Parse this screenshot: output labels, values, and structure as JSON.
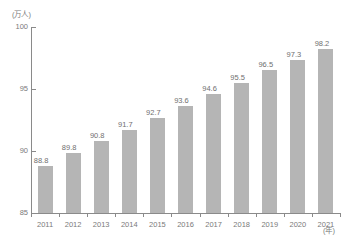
{
  "chart_data": {
    "type": "bar",
    "title": "",
    "subtitle": "",
    "xlabel": "(年)",
    "ylabel": "(万人)",
    "categories": [
      "2011",
      "2012",
      "2013",
      "2014",
      "2015",
      "2016",
      "2017",
      "2018",
      "2019",
      "2020",
      "2021"
    ],
    "values": [
      88.8,
      89.8,
      90.8,
      91.7,
      92.7,
      93.6,
      94.6,
      95.5,
      96.5,
      97.3,
      98.2
    ],
    "value_labels": [
      "88.8",
      "89.8",
      "90.8",
      "91.7",
      "92.7",
      "93.6",
      "94.6",
      "95.5",
      "96.5",
      "97.3",
      "98.2"
    ],
    "ylim": [
      85,
      100
    ],
    "yticks": [
      85,
      90,
      95,
      100
    ],
    "ytick_labels": [
      "85",
      "90",
      "95",
      "100"
    ],
    "grid": false,
    "legend": null,
    "legend_position": "none",
    "bar_color": "#b5b5b5",
    "axis_color": "#8a8a8a",
    "text_color": "#6f6f6f"
  },
  "axis": {
    "y_unit": "(万人)",
    "x_unit": "(年)"
  }
}
